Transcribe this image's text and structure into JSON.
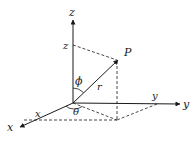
{
  "diagram": {
    "type": "spherical-coordinate-system",
    "axes": {
      "z_axis_label": "z",
      "y_axis_label": "y",
      "x_axis_label": "x"
    },
    "projections": {
      "z_component_label": "z",
      "y_component_label": "y",
      "x_component_label": "x"
    },
    "point_label": "P",
    "radius_label": "r",
    "polar_angle_label": "ϕ",
    "azimuth_angle_label": "θ",
    "colors": {
      "line": "#1a1a1a",
      "background": "#ffffff"
    }
  }
}
